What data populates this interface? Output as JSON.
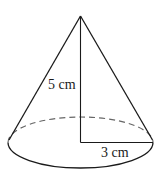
{
  "diagram": {
    "type": "cone",
    "labels": {
      "slant_height": "5 cm",
      "radius": "3 cm"
    },
    "colors": {
      "stroke": "#1a1a1a",
      "dashed": "#555555",
      "background": "#ffffff"
    }
  }
}
